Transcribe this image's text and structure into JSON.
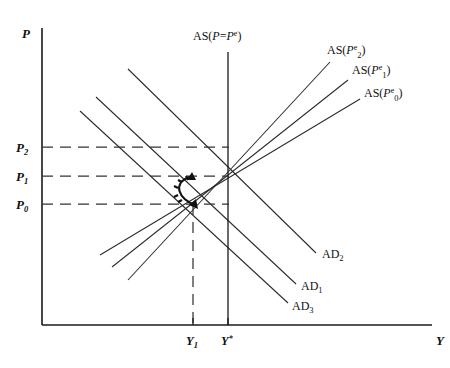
{
  "figure": {
    "axes": {
      "y_label": "P",
      "x_label": "Y",
      "origin": {
        "x": 42,
        "y": 325
      },
      "y_top": 28,
      "x_right": 432
    },
    "price_levels": [
      {
        "id": "P2",
        "label": "P",
        "subscript": "2",
        "y": 147,
        "dash_to_x": 229
      },
      {
        "id": "P1",
        "label": "P",
        "subscript": "1",
        "y": 176,
        "dash_to_x": 229
      },
      {
        "id": "P0",
        "label": "P",
        "subscript": "0",
        "y": 204,
        "dash_to_x": 229
      }
    ],
    "output_levels": [
      {
        "id": "Y1",
        "label": "Y",
        "subscript": "1",
        "x": 193,
        "tick_top": 318
      },
      {
        "id": "Ystar",
        "label": "Y",
        "superscript": "*",
        "x": 228,
        "tick_top": 318
      }
    ],
    "vertical_as": {
      "name": "AS(P=Pe)",
      "label_main": "AS(",
      "label_italic_p": "P",
      "label_eq": "=",
      "label_italic_pe": "P",
      "label_sup": "e",
      "label_close": ")",
      "x": 228,
      "y_top": 52,
      "y_bottom": 325,
      "label_x": 193,
      "label_y": 40
    },
    "as_curves": [
      {
        "id": "AS2",
        "label_prefix": "AS(",
        "label_italic": "P",
        "label_sub": "2",
        "label_sup": "e",
        "label_suffix": ")",
        "x1": 128,
        "y1": 280,
        "x2": 330,
        "y2": 62,
        "label_x": 327,
        "label_y": 50
      },
      {
        "id": "AS1",
        "label_prefix": "AS(",
        "label_italic": "P",
        "label_sub": "1",
        "label_sup": "e",
        "label_suffix": ")",
        "x1": 112,
        "y1": 267,
        "x2": 348,
        "y2": 80,
        "label_x": 352,
        "label_y": 70
      },
      {
        "id": "AS0",
        "label_prefix": "AS(",
        "label_italic": "P",
        "label_sub": "0",
        "label_sup": "e",
        "label_suffix": ")",
        "x1": 100,
        "y1": 255,
        "x2": 360,
        "y2": 99,
        "label_x": 364,
        "label_y": 93
      }
    ],
    "ad_curves": [
      {
        "id": "AD2",
        "label_prefix": "AD",
        "label_sub": "2",
        "x1": 128,
        "y1": 69,
        "x2": 316,
        "y2": 253,
        "label_x": 322,
        "label_y": 254
      },
      {
        "id": "AD1",
        "label_prefix": "AD",
        "label_sub": "1",
        "x1": 96,
        "y1": 97,
        "x2": 296,
        "y2": 284,
        "label_x": 301,
        "label_y": 286
      },
      {
        "id": "AD3",
        "label_prefix": "AD",
        "label_sub": "3",
        "x1": 80,
        "y1": 111,
        "x2": 288,
        "y2": 303,
        "label_x": 292,
        "label_y": 306
      }
    ],
    "guides": {
      "vertical_dashed_y1": {
        "x": 193,
        "y_top": 204,
        "y_bottom": 325
      }
    },
    "adjustment_arrow": {
      "description": "curved arrow from P0 equilibrium up to P1 equilibrium",
      "from_x": 193,
      "from_y": 204,
      "to_x": 193,
      "to_y": 176
    }
  }
}
